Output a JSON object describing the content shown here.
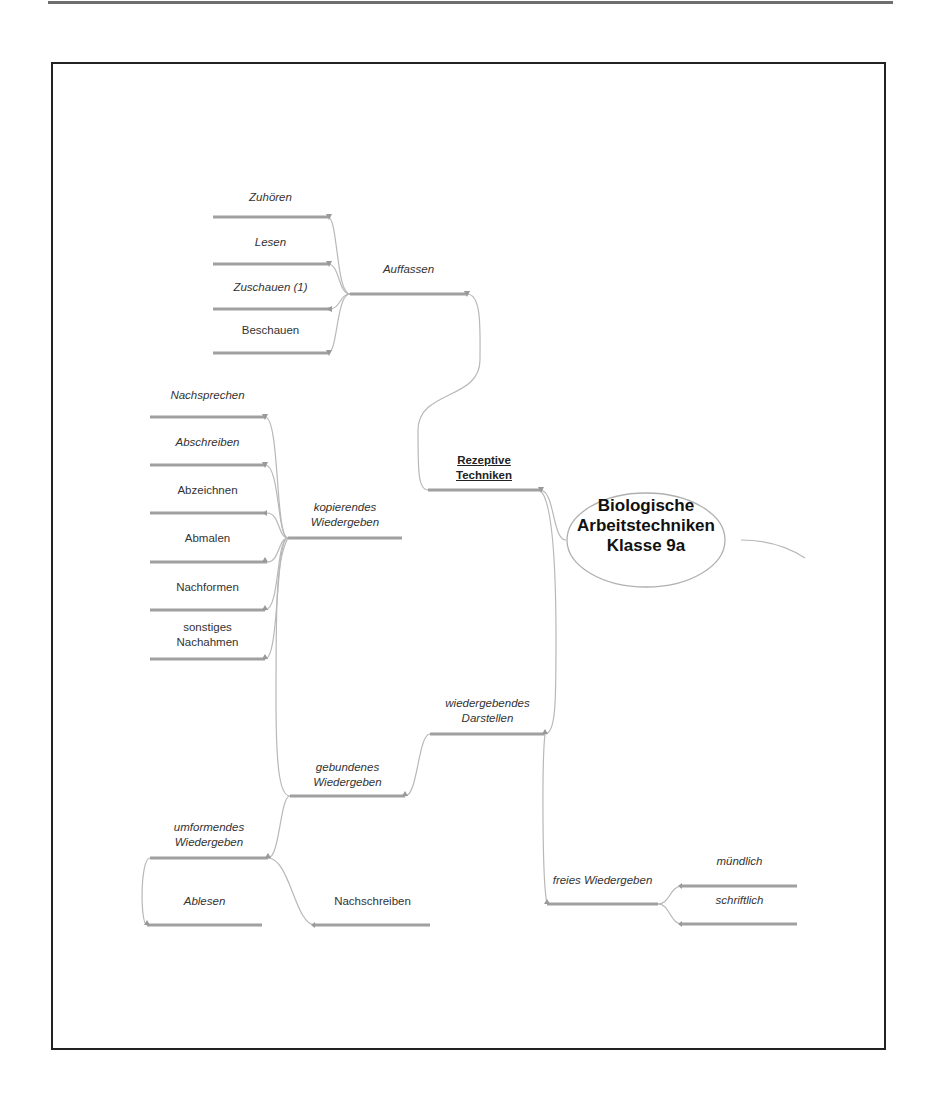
{
  "mindmap": {
    "center": {
      "line1": "Biologische",
      "line2": "Arbeitstechniken",
      "line3": "Klasse 9a"
    },
    "branches": {
      "rezeptive": {
        "line1": "Rezeptive",
        "line2": "Techniken"
      },
      "auffassen": {
        "label": "Auffassen",
        "children": [
          "Zuhören",
          "Lesen",
          "Zuschauen (1)",
          "Beschauen"
        ]
      },
      "wiedergebendes": {
        "line1": "wiedergebendes",
        "line2": "Darstellen"
      },
      "kopierendes": {
        "line1": "kopierendes",
        "line2": "Wiedergeben",
        "children": [
          "Nachsprechen",
          "Abschreiben",
          "Abzeichnen",
          "Abmalen",
          "Nachformen"
        ],
        "last_child": {
          "line1": "sonstiges",
          "line2": "Nachahmen"
        }
      },
      "gebundenes": {
        "line1": "gebundenes",
        "line2": "Wiedergeben"
      },
      "umformendes": {
        "line1": "umformendes",
        "line2": "Wiedergeben",
        "children": [
          "Ablesen",
          "Nachschreiben"
        ]
      },
      "freies": {
        "label": "freies Wiedergeben",
        "children": [
          "mündlich",
          "schriftlich"
        ]
      }
    }
  },
  "colors": {
    "line": "#9a9a9a",
    "connector": "#b5b5b5",
    "frame": "#222222",
    "text": "#333333"
  }
}
